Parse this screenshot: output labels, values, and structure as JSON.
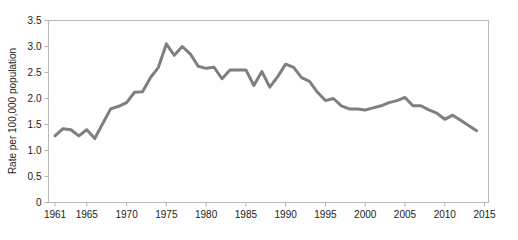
{
  "chart_data": {
    "type": "line",
    "title": "",
    "subtitle": "",
    "xlabel": "",
    "ylabel": "Rate per 100,000 population",
    "xlim": [
      1960,
      2015.5
    ],
    "ylim": [
      0,
      3.5
    ],
    "grid": false,
    "legend": null,
    "x_ticks": [
      "1961",
      "1965",
      "1970",
      "1975",
      "1980",
      "1985",
      "1990",
      "1995",
      "2000",
      "2005",
      "2010",
      "2015"
    ],
    "x_tick_values": [
      1961,
      1965,
      1970,
      1975,
      1980,
      1985,
      1990,
      1995,
      2000,
      2005,
      2010,
      2015
    ],
    "y_ticks": [
      "0",
      "0.5",
      "1.0",
      "1.5",
      "2.0",
      "2.5",
      "3.0",
      "3.5"
    ],
    "y_tick_values": [
      0,
      0.5,
      1.0,
      1.5,
      2.0,
      2.5,
      3.0,
      3.5
    ],
    "line_color": "#7f7f7f",
    "line_width": 3,
    "axis_color": "#b0b0b0",
    "x": [
      1961,
      1962,
      1963,
      1964,
      1965,
      1966,
      1967,
      1968,
      1969,
      1970,
      1971,
      1972,
      1973,
      1974,
      1975,
      1976,
      1977,
      1978,
      1979,
      1980,
      1981,
      1982,
      1983,
      1984,
      1985,
      1986,
      1987,
      1988,
      1989,
      1990,
      1991,
      1992,
      1993,
      1994,
      1995,
      1996,
      1997,
      1998,
      1999,
      2000,
      2001,
      2002,
      2003,
      2004,
      2005,
      2006,
      2007,
      2008,
      2009,
      2010,
      2011,
      2012,
      2013,
      2014
    ],
    "values": [
      1.28,
      1.42,
      1.4,
      1.28,
      1.4,
      1.23,
      1.52,
      1.8,
      1.85,
      1.92,
      2.12,
      2.13,
      2.4,
      2.6,
      3.05,
      2.83,
      3.0,
      2.86,
      2.62,
      2.58,
      2.6,
      2.38,
      2.55,
      2.55,
      2.55,
      2.25,
      2.52,
      2.22,
      2.42,
      2.66,
      2.6,
      2.4,
      2.33,
      2.12,
      1.96,
      2.0,
      1.86,
      1.8,
      1.8,
      1.78,
      1.82,
      1.86,
      1.92,
      1.96,
      2.02,
      1.86,
      1.86,
      1.78,
      1.72,
      1.6,
      1.68,
      1.58,
      1.48,
      1.38
    ],
    "series": [
      {
        "name": "Rate per 100,000 population",
        "color": "#7f7f7f",
        "values": [
          1.28,
          1.42,
          1.4,
          1.28,
          1.4,
          1.23,
          1.52,
          1.8,
          1.85,
          1.92,
          2.12,
          2.13,
          2.4,
          2.6,
          3.05,
          2.83,
          3.0,
          2.86,
          2.62,
          2.58,
          2.6,
          2.38,
          2.55,
          2.55,
          2.55,
          2.25,
          2.52,
          2.22,
          2.42,
          2.66,
          2.6,
          2.4,
          2.33,
          2.12,
          1.96,
          2.0,
          1.86,
          1.8,
          1.8,
          1.78,
          1.82,
          1.86,
          1.92,
          1.96,
          2.02,
          1.86,
          1.86,
          1.78,
          1.72,
          1.6,
          1.68,
          1.58,
          1.48,
          1.38
        ]
      }
    ]
  },
  "axis": {
    "y_title": "Rate per 100,000 population"
  },
  "caption": {
    "text": ""
  }
}
